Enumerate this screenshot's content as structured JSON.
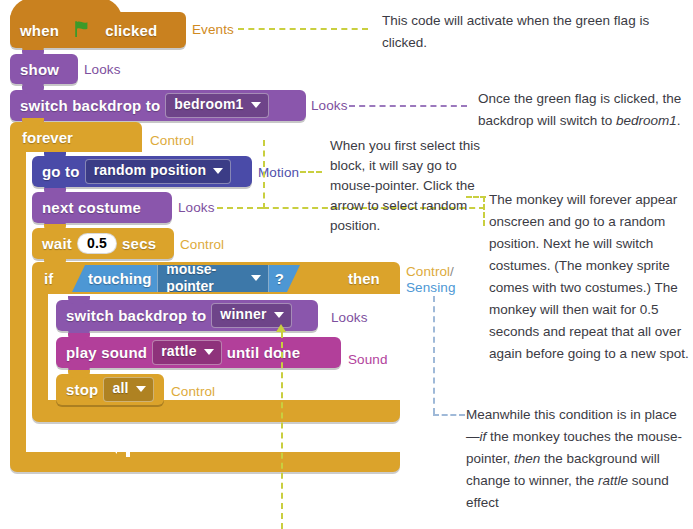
{
  "meta": {
    "palette": {
      "events": "#c9811f",
      "looks": "#8a56ac",
      "motion": "#4a4ba8",
      "control": "#dba32b",
      "sound": "#b23f9a",
      "sensing": "#4d97d4",
      "leader_yellow": "#c9cf3f",
      "leader_purple": "#9b78bd",
      "leader_blue": "#9fb9d8",
      "note_text": "#3b3b44",
      "flag_green": "#3c9a29"
    }
  },
  "script": {
    "blocks": [
      {
        "id": "when-flag-clicked",
        "category": "Events",
        "text_before": "when",
        "icon": "green-flag-icon",
        "text_after": "clicked"
      },
      {
        "id": "show",
        "category": "Looks",
        "label": "show"
      },
      {
        "id": "switch-backdrop-bedroom1",
        "category": "Looks",
        "label": "switch backdrop to",
        "dropdown": "bedroom1"
      },
      {
        "id": "forever",
        "category": "Control",
        "label": "forever"
      },
      {
        "id": "go-to-random-position",
        "category": "Motion",
        "label": "go to",
        "dropdown": "random position"
      },
      {
        "id": "next-costume",
        "category": "Looks",
        "label": "next costume"
      },
      {
        "id": "wait-secs",
        "category": "Control",
        "label_before": "wait",
        "value": "0.5",
        "label_after": "secs"
      },
      {
        "id": "if-then",
        "category": "Control",
        "label_if": "if",
        "label_then": "then"
      },
      {
        "id": "touching-mouse-pointer",
        "category": "Sensing",
        "label": "touching",
        "dropdown": "mouse-pointer",
        "suffix": "?"
      },
      {
        "id": "switch-backdrop-winner",
        "category": "Looks",
        "label": "switch backdrop to",
        "dropdown": "winner"
      },
      {
        "id": "play-sound-until-done",
        "category": "Sound",
        "label_before": "play sound",
        "dropdown": "rattle",
        "label_after": "until done"
      },
      {
        "id": "stop-all",
        "category": "Control",
        "label": "stop",
        "dropdown": "all"
      }
    ]
  },
  "category_labels": {
    "events": "Events",
    "looks_show": "Looks",
    "looks_backdrop": "Looks",
    "control_forever": "Control",
    "motion": "Motion",
    "looks_costume": "Looks",
    "control_wait": "Control",
    "control_if": "Control",
    "slash": "/",
    "sensing": "Sensing",
    "looks_winner": "Looks",
    "sound": "Sound",
    "control_stop": "Control"
  },
  "annotations": {
    "flag_note": "This code will activate when the green flag is clicked.",
    "backdrop_note_plain_1": "Once the green flag is clicked, the backdrop will switch to ",
    "backdrop_note_italic": "bedroom1",
    "backdrop_note_plain_2": ".",
    "dropdown_note": "When you first select this block, it will say go to mouse-pointer. Click the arrow to select random position.",
    "forever_note": "The monkey will forever appear onscreen and go to a random position. Next he will switch costumes. (The monkey sprite comes with two costumes.) The monkey will then wait for 0.5 seconds and repeat that all over again before going to a new spot.",
    "if_note_1": "Meanwhile this condition is in place—",
    "if_note_if": "if",
    "if_note_2": " the monkey touches the mouse-pointer, ",
    "if_note_then": "then",
    "if_note_3": " the background will change to winner, the ",
    "if_note_rattle": "rattle",
    "if_note_4": " sound effect"
  }
}
